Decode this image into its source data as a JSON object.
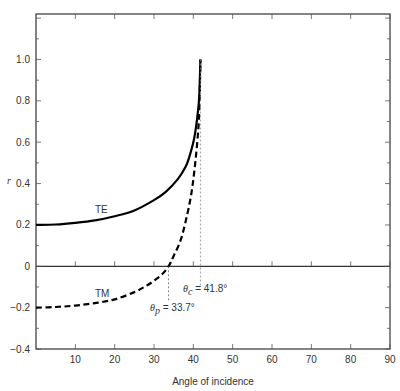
{
  "chart_data": {
    "type": "line",
    "title": "",
    "xlabel": "Angle of incidence",
    "ylabel": "r",
    "xlim": [
      0,
      90
    ],
    "ylim": [
      -0.4,
      1.2
    ],
    "x_ticks": [
      10,
      20,
      30,
      40,
      50,
      60,
      70,
      80,
      90
    ],
    "y_ticks": [
      -0.4,
      -0.2,
      0,
      0.2,
      0.4,
      0.6,
      0.8,
      1.0
    ],
    "y_tick_labels": [
      "-0.4",
      "-0.2",
      "0",
      "0.2",
      "0.4",
      "0.6",
      "0.8",
      "1.0"
    ],
    "grid": false,
    "series": [
      {
        "name": "TE",
        "style": "solid",
        "x": [
          0,
          5,
          10,
          15,
          20,
          25,
          30,
          33,
          36,
          38,
          39,
          40,
          40.5,
          41,
          41.5,
          41.8
        ],
        "values": [
          0.2,
          0.202,
          0.21,
          0.222,
          0.242,
          0.27,
          0.32,
          0.36,
          0.42,
          0.48,
          0.53,
          0.6,
          0.65,
          0.72,
          0.82,
          1.0
        ]
      },
      {
        "name": "TM",
        "style": "dashed",
        "x": [
          0,
          5,
          10,
          15,
          20,
          25,
          28,
          30,
          32,
          33.7,
          35,
          37,
          39,
          40,
          41,
          41.5,
          41.8
        ],
        "values": [
          -0.2,
          -0.197,
          -0.19,
          -0.178,
          -0.16,
          -0.125,
          -0.095,
          -0.07,
          -0.04,
          0,
          0.05,
          0.14,
          0.3,
          0.42,
          0.6,
          0.75,
          1.0
        ]
      }
    ],
    "annotations": [
      {
        "text": "TE",
        "x": 15,
        "y": 0.27
      },
      {
        "text": "TM",
        "x": 15,
        "y": -0.13
      },
      {
        "text": "θ'p = 33.7°",
        "x": 33.7,
        "y": -0.2,
        "marker": "vertical dashed line at x=33.7"
      },
      {
        "text": "θc = 41.8°",
        "x": 41.8,
        "y": -0.13,
        "marker": "vertical dashed line at x=41.8"
      }
    ],
    "reference_line": {
      "y": 0,
      "style": "solid"
    }
  },
  "labels": {
    "ylabel": "r",
    "xlabel": "Angle of incidence",
    "te": "TE",
    "tm": "TM",
    "theta_p_sym": "θ",
    "theta_p_sub": "p",
    "theta_p_val": " = 33.7°",
    "theta_c_sym": "θ",
    "theta_c_sub": "c",
    "theta_c_val": " = 41.8°"
  }
}
